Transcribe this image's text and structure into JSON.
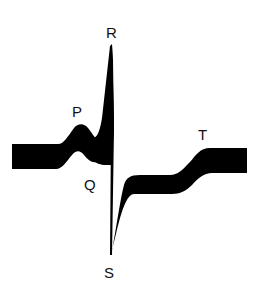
{
  "diagram": {
    "type": "ecg-waveform",
    "colors": {
      "trace": "#000000",
      "background": "#ffffff",
      "label": "#111111"
    },
    "labels": {
      "p": "P",
      "q": "Q",
      "r": "R",
      "s": "S",
      "t": "T"
    }
  }
}
